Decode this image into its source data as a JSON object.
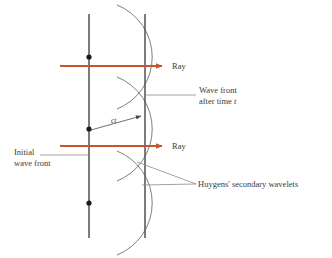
{
  "figure": {
    "background_color": "#ffffff",
    "width": 332,
    "height": 258,
    "colors": {
      "ray": "#c4562f",
      "line": "#4a4a4a",
      "arc": "#6e6e6e",
      "leader": "#8a8a8a",
      "text": "#3a3a3a",
      "dot": "#1a1a1a"
    }
  },
  "labels": {
    "ray_top": "Ray",
    "ray_bottom": "Ray",
    "wave_front_line1": "Wave front",
    "wave_front_line2_prefix": "after time ",
    "wave_front_line2_italic": "t",
    "initial_line1": "Initial",
    "initial_line2": "wave front",
    "huygens": "Huygens' secondary wavelets",
    "ct": "ct"
  },
  "geometry": {
    "initial_front_x": 89,
    "initial_front_y_top": 14,
    "initial_front_y_bottom": 238,
    "new_front_x": 145,
    "new_front_y_top": 14,
    "new_front_y_bottom": 238,
    "source_points": [
      {
        "x": 89,
        "y": 57
      },
      {
        "x": 89,
        "y": 129
      },
      {
        "x": 89,
        "y": 203
      }
    ],
    "wavelet_radius": 56,
    "rays": [
      {
        "x_start": 60,
        "x_end": 163,
        "y": 66
      },
      {
        "x_start": 60,
        "x_end": 163,
        "y": 146
      }
    ],
    "ct_arrow": {
      "x_start": 90,
      "y_start": 130,
      "x_end": 142,
      "y_end": 116
    }
  }
}
